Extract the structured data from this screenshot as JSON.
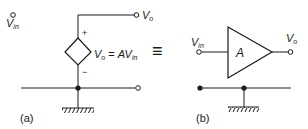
{
  "figure_a": {
    "caption": "(a)",
    "input_label": "V",
    "input_sub": "in",
    "output_label": "V",
    "output_sub": "o",
    "plus_sign": "+",
    "minus_sign": "−",
    "source_equation": {
      "lhs": "V",
      "lhs_sub": "o",
      "equals": " = ",
      "rhs": "AV",
      "rhs_sub": "in"
    }
  },
  "equivalence_symbol": "≡",
  "figure_b": {
    "caption": "(b)",
    "input_label": "V",
    "input_sub": "in",
    "output_label": "V",
    "output_sub": "o",
    "amplifier_gain": "A"
  },
  "colors": {
    "stroke": "#1a1a1a",
    "background": "#ffffff"
  }
}
